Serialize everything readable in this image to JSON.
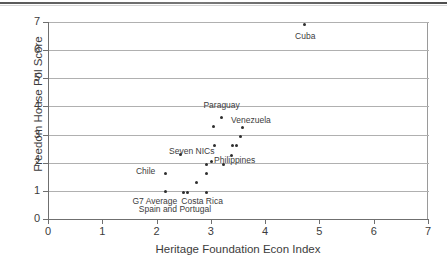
{
  "chart_data": {
    "type": "scatter",
    "title": "",
    "xlabel": "Heritage Foundation Econ Index",
    "ylabel": "Freedom House Pol Score",
    "xlim": [
      0,
      7
    ],
    "ylim": [
      0,
      7
    ],
    "xticks": [
      "0",
      "1",
      "2",
      "3",
      "4",
      "5",
      "6",
      "7"
    ],
    "yticks": [
      "0",
      "1",
      "2",
      "3",
      "4",
      "5",
      "6",
      "7"
    ],
    "grid": "horizontal",
    "legend": "none",
    "marker_color": "#2e2e2e",
    "points": [
      {
        "label": "Cuba",
        "x": 4.7,
        "y": 6.9
      },
      {
        "label": "Venezuela",
        "x": 3.57,
        "y": 3.26
      },
      {
        "label": "Paraguay",
        "x": 3.18,
        "y": 3.6
      },
      {
        "label": "",
        "x": 3.03,
        "y": 3.27
      },
      {
        "label": "",
        "x": 3.53,
        "y": 2.92
      },
      {
        "label": "",
        "x": 3.38,
        "y": 2.6
      },
      {
        "label": "",
        "x": 3.46,
        "y": 2.6
      },
      {
        "label": "",
        "x": 3.05,
        "y": 2.62
      },
      {
        "label": "Philippines",
        "x": 3.37,
        "y": 2.26
      },
      {
        "label": "Seven NICs",
        "x": 2.42,
        "y": 2.3
      },
      {
        "label": "",
        "x": 2.9,
        "y": 1.93
      },
      {
        "label": "",
        "x": 2.99,
        "y": 2.04
      },
      {
        "label": "",
        "x": 3.22,
        "y": 1.93
      },
      {
        "label": "Chile",
        "x": 2.15,
        "y": 1.63
      },
      {
        "label": "",
        "x": 2.9,
        "y": 1.62
      },
      {
        "label": "",
        "x": 2.72,
        "y": 1.28
      },
      {
        "label": "G7 Average",
        "x": 2.15,
        "y": 0.96
      },
      {
        "label": "Spain and Portugal",
        "x": 2.47,
        "y": 0.95
      },
      {
        "label": "",
        "x": 2.56,
        "y": 0.95
      },
      {
        "label": "Costa Rica",
        "x": 2.9,
        "y": 0.95
      }
    ],
    "annotations": [
      {
        "text": "Cuba",
        "x": 4.72,
        "y": 6.45
      },
      {
        "text": "Paraguay",
        "x": 3.18,
        "y": 4.0
      },
      {
        "text": "Venezuela",
        "x": 3.72,
        "y": 3.5
      },
      {
        "text": "Seven NICs",
        "x": 2.63,
        "y": 2.37
      },
      {
        "text": "Philippines",
        "x": 3.42,
        "y": 2.06
      },
      {
        "text": "Chile",
        "x": 1.78,
        "y": 1.67
      },
      {
        "text": "G7 Average",
        "x": 1.95,
        "y": 0.62
      },
      {
        "text": "Costa Rica",
        "x": 2.82,
        "y": 0.62
      },
      {
        "text": "Spain and Portugal",
        "x": 2.32,
        "y": 0.33
      }
    ]
  }
}
